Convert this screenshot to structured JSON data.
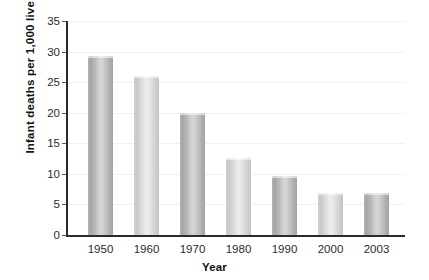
{
  "chart_data": {
    "type": "bar",
    "title": "",
    "xlabel": "Year",
    "ylabel": "Infant deaths per 1,000 live births",
    "categories": [
      "1950",
      "1960",
      "1970",
      "1980",
      "1990",
      "2000",
      "2003"
    ],
    "values": [
      29.2,
      26.0,
      20.0,
      12.6,
      9.6,
      6.8,
      6.8
    ],
    "ylim": [
      0,
      35
    ],
    "yticks": [
      "0",
      "5",
      "10",
      "15",
      "20",
      "25",
      "30",
      "35"
    ],
    "ytick_values": [
      0,
      5,
      10,
      15,
      20,
      25,
      30,
      35
    ],
    "grid": true,
    "legend": "none",
    "bar_styles": [
      "dark",
      "light",
      "dark",
      "light",
      "dark",
      "light",
      "dark"
    ],
    "colors": {
      "bar_dark": "#b0b0b0",
      "bar_light": "#d8d8d8",
      "axis": "#2b2b2b",
      "gridline": "#f1f1f3",
      "text": "#2b2b2b",
      "background": "#ffffff"
    }
  }
}
